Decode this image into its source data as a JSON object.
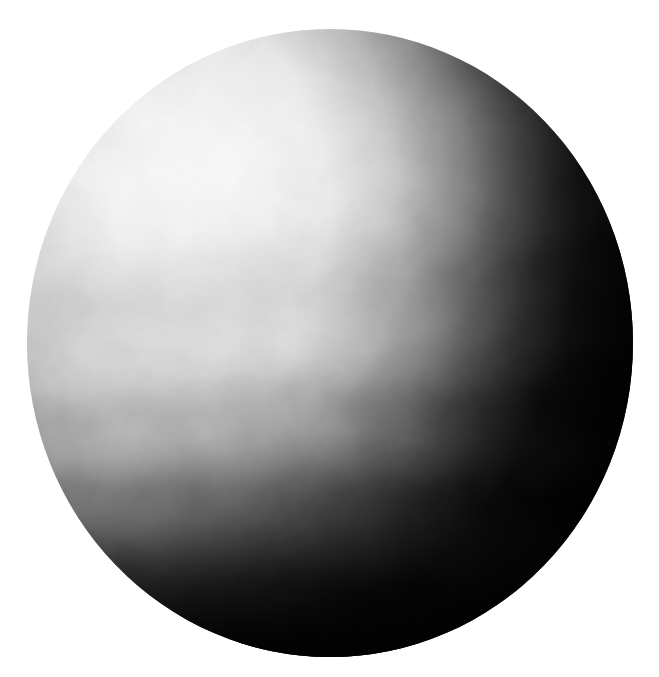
{
  "image": {
    "subject": "Venus",
    "description": "Monochrome full-disk view of the planet Venus showing banded sulfuric-acid cloud tops, illuminated from the upper left with a dark terminator along the right limb and south pole.",
    "alt_text": "Greyscale image of Venus",
    "background_color": "#ffffff",
    "canvas": {
      "width": 659,
      "height": 677
    }
  },
  "disk": {
    "label": "venus-disk",
    "center_x": 330,
    "center_y": 343,
    "left": 27,
    "top": 29,
    "width": 606,
    "height": 628,
    "radius_x": 303,
    "radius_y": 314,
    "illumination_direction": "upper-left",
    "terminator_side": "right",
    "colors": {
      "brightest": "#f2f2f2",
      "bright_cloud": "#e6e6e6",
      "mid_tone": "#b4b4b4",
      "shadow": "#3a3a3a",
      "deep_shadow": "#070707",
      "limb_dark": "#8c8c8c"
    }
  },
  "features": [
    {
      "name": "northern-bright-cap",
      "type": "bright-region",
      "center_x": 200,
      "center_y": 155,
      "tone": "#f0f0f0",
      "note": "Brightest illuminated cloud deck in the upper-left quadrant"
    },
    {
      "name": "mid-latitude-dark-patch",
      "type": "dark-cloud-patch",
      "center_x": 270,
      "center_y": 250,
      "tone": "#c8c8c8",
      "note": "Diffuse mottled darker cloud material across the upper middle"
    },
    {
      "name": "equatorial-band",
      "type": "cloud-band",
      "center_y": 370,
      "tone": "#d8d8d8",
      "note": "Broad light band crossing the disk centre"
    },
    {
      "name": "southern-bright-arc",
      "type": "cloud-band",
      "center_y": 500,
      "tone": "#e4e4e4",
      "note": "Prominent bright latitude arc in the lower-left, curving with the sphere"
    },
    {
      "name": "south-polar-collar",
      "type": "dark-region",
      "center_y": 600,
      "tone": "#101010",
      "note": "Dark polar collar merging into the shadowed limb"
    },
    {
      "name": "terminator",
      "type": "shadow-boundary",
      "tone": "#050505",
      "note": "Night side shading dominating the right third of the disk"
    }
  ],
  "bands": [
    {
      "name": "band-north-1",
      "cy": 118,
      "rx": 340,
      "ry": 52,
      "tone": "#ffffff",
      "opacity": 0.2,
      "rotate": -6
    },
    {
      "name": "band-north-2",
      "cy": 196,
      "rx": 330,
      "ry": 40,
      "tone": "#ffffff",
      "opacity": 0.16,
      "rotate": -5
    },
    {
      "name": "band-dark-1",
      "cy": 252,
      "rx": 300,
      "ry": 46,
      "tone": "#5a5a5a",
      "opacity": 0.13,
      "rotate": -4
    },
    {
      "name": "band-mid-1",
      "cy": 320,
      "rx": 330,
      "ry": 34,
      "tone": "#ffffff",
      "opacity": 0.17,
      "rotate": -3
    },
    {
      "name": "band-dark-2",
      "cy": 372,
      "rx": 320,
      "ry": 30,
      "tone": "#4a4a4a",
      "opacity": 0.1,
      "rotate": -2
    },
    {
      "name": "band-mid-2",
      "cy": 424,
      "rx": 320,
      "ry": 34,
      "tone": "#ffffff",
      "opacity": 0.22,
      "rotate": 0
    },
    {
      "name": "band-dark-3",
      "cy": 470,
      "rx": 300,
      "ry": 26,
      "tone": "#3c3c3c",
      "opacity": 0.12,
      "rotate": 2
    },
    {
      "name": "band-south-1",
      "cy": 512,
      "rx": 300,
      "ry": 38,
      "tone": "#ffffff",
      "opacity": 0.3,
      "rotate": 4
    },
    {
      "name": "band-dark-4",
      "cy": 556,
      "rx": 276,
      "ry": 26,
      "tone": "#2a2a2a",
      "opacity": 0.16,
      "rotate": 6
    },
    {
      "name": "band-south-2",
      "cy": 586,
      "rx": 250,
      "ry": 24,
      "tone": "#ffffff",
      "opacity": 0.16,
      "rotate": 8
    }
  ],
  "texture": {
    "name": "cloud-mottle",
    "base_frequency": 0.016,
    "octaves": 4,
    "opacity": 0.3
  }
}
